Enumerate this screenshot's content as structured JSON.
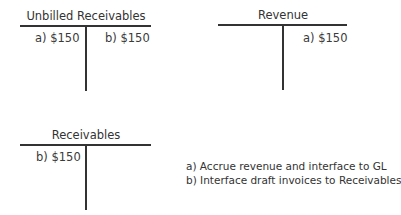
{
  "accounts": [
    {
      "name": "Unbilled Receivables",
      "debits": [
        "a) $150"
      ],
      "credits": [
        "b) $150"
      ]
    },
    {
      "name": "Revenue",
      "debits": [],
      "credits": [
        "a) $150"
      ]
    },
    {
      "name": "Receivables",
      "debits": [
        "b) $150"
      ],
      "credits": []
    }
  ],
  "legend": [
    "a) Accrue revenue and interface to GL",
    "b) Interface draft invoices to Receivables"
  ]
}
